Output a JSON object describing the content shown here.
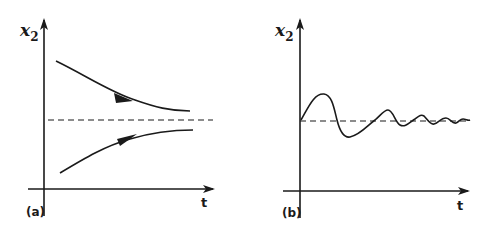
{
  "figure": {
    "panels": [
      {
        "id": "a",
        "caption": "(a)",
        "y_label": "x",
        "y_label_sub": "2",
        "x_label": "t",
        "description": "Two trajectories monotonically converging to equilibrium (dashed line) from above and below"
      },
      {
        "id": "b",
        "caption": "(b)",
        "y_label": "x",
        "y_label_sub": "2",
        "x_label": "t",
        "description": "Damped oscillation around equilibrium (dashed line)"
      }
    ]
  },
  "colors": {
    "ink": "#1a1a1a",
    "background": "#ffffff"
  }
}
